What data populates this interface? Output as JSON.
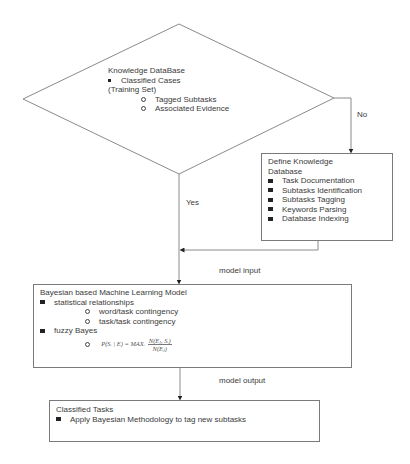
{
  "decision": {
    "title": "Knowledge DataBase",
    "bullet": "Classified Cases",
    "subtitle": "(Training Set)",
    "subitems": [
      "Tagged Subtasks",
      "Associated Evidence"
    ]
  },
  "edges": {
    "no_label": "No",
    "yes_label": "Yes",
    "model_input_label": "model input",
    "model_output_label": "model output"
  },
  "define_box": {
    "title_line1": "Define Knowledge",
    "title_line2": "Database",
    "items": [
      "Task Documentation",
      "Subtasks Identification",
      "Subtasks Tagging",
      "Keywords Parsing",
      "Database Indexing"
    ]
  },
  "model_box": {
    "title": "Bayesian based Machine Learning Model",
    "bullet1": "statistical relationships",
    "sub1": [
      "word/task contingency",
      "task/task contingency"
    ],
    "bullet2": "fuzzy Bayes",
    "formula": {
      "lhs": "P(Sᵢ | E) = MAXᵢ",
      "numerator": "N(Eⱼ, Sᵢ)",
      "denominator": "N(Eⱼ)"
    }
  },
  "classified_box": {
    "title": "Classified Tasks",
    "item": "Apply Bayesian Methodology to tag new subtasks"
  },
  "colors": {
    "line": "#8a8a8a",
    "text": "#3a3a3a"
  }
}
